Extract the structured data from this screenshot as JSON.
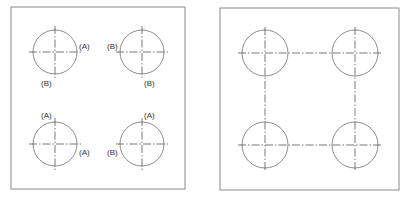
{
  "colors": {
    "line": "#6e6e6e",
    "frame": "#8a8a8a",
    "text": "#333333"
  },
  "left_panel": {
    "frame": {
      "x": 11,
      "y": 7,
      "w": 174,
      "h": 182
    },
    "radius": 22,
    "holes": [
      {
        "cx": 55,
        "cy": 52,
        "labels": [
          {
            "text": "(A)",
            "x": 79,
            "y": 49
          },
          {
            "text": "(B)",
            "x": 41,
            "y": 84
          }
        ]
      },
      {
        "cx": 142,
        "cy": 52,
        "labels": [
          {
            "text": "(B)",
            "x": 107,
            "y": 49
          },
          {
            "text": "(B)",
            "x": 144,
            "y": 86
          }
        ]
      },
      {
        "cx": 55,
        "cy": 144,
        "labels": [
          {
            "text": "(A)",
            "x": 41,
            "y": 118
          },
          {
            "text": "(A)",
            "x": 79,
            "y": 154
          }
        ]
      },
      {
        "cx": 142,
        "cy": 144,
        "labels": [
          {
            "text": "(A)",
            "x": 144,
            "y": 118
          },
          {
            "text": "(B)",
            "x": 107,
            "y": 154
          }
        ]
      }
    ]
  },
  "right_panel": {
    "frame": {
      "x": 220,
      "y": 8,
      "w": 179,
      "h": 182
    },
    "radius": 23,
    "holes": [
      {
        "cx": 265,
        "cy": 53
      },
      {
        "cx": 355,
        "cy": 53
      },
      {
        "cx": 265,
        "cy": 145
      },
      {
        "cx": 355,
        "cy": 145
      }
    ]
  },
  "labels": {
    "l1": "(A)",
    "l2": "(B)",
    "l3": "(B)",
    "l4": "(B)",
    "l5": "(A)",
    "l6": "(A)",
    "l7": "(A)",
    "l8": "(B)"
  }
}
